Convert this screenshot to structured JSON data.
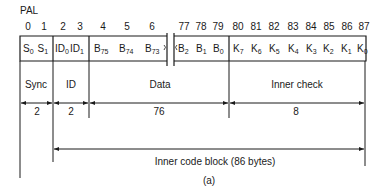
{
  "title": "PAL",
  "caption": "(a)",
  "byte_indices": {
    "left": [
      "0",
      "1",
      "2",
      "3",
      "4",
      "5",
      "6"
    ],
    "right": [
      "77",
      "78",
      "79",
      "80",
      "81",
      "82",
      "83",
      "84",
      "85",
      "86",
      "87"
    ]
  },
  "cells": {
    "sync": [
      {
        "base": "S",
        "sub": "0"
      },
      {
        "base": "S",
        "sub": "1"
      }
    ],
    "id": [
      {
        "base": "ID",
        "sub": "0"
      },
      {
        "base": "ID",
        "sub": "1"
      }
    ],
    "data_left": [
      {
        "base": "B",
        "sub": "75"
      },
      {
        "base": "B",
        "sub": "74"
      },
      {
        "base": "B",
        "sub": "73"
      }
    ],
    "data_right": [
      {
        "base": "B",
        "sub": "2"
      },
      {
        "base": "B",
        "sub": "1"
      },
      {
        "base": "B",
        "sub": "0"
      }
    ],
    "check": [
      {
        "base": "K",
        "sub": "7"
      },
      {
        "base": "K",
        "sub": "6"
      },
      {
        "base": "K",
        "sub": "5"
      },
      {
        "base": "K",
        "sub": "4"
      },
      {
        "base": "K",
        "sub": "3"
      },
      {
        "base": "K",
        "sub": "2"
      },
      {
        "base": "K",
        "sub": "1"
      },
      {
        "base": "K",
        "sub": "0"
      }
    ]
  },
  "fields": [
    {
      "name": "Sync",
      "length": "2"
    },
    {
      "name": "ID",
      "length": "2"
    },
    {
      "name": "Data",
      "length": "76"
    },
    {
      "name": "Inner check",
      "length": "8"
    }
  ],
  "block_label": "Inner code block (86 bytes)"
}
